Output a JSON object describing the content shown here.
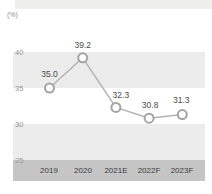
{
  "colors": {
    "band_light": "#ececec",
    "axis_band": "#c5c5c5",
    "top_strip": "#eeefec",
    "line": "#b3b3b3",
    "marker_stroke": "#a3a3a3",
    "marker_fill": "#ffffff",
    "point_label_text": "#4a4a4a",
    "tick_text": "#929292",
    "category_text": "#3c3c3c"
  },
  "chart_data": {
    "type": "line",
    "categories": [
      "2019",
      "2020",
      "2021E",
      "2022F",
      "2023F"
    ],
    "values": [
      35.0,
      39.2,
      32.3,
      30.8,
      31.3
    ],
    "point_labels": [
      "35.0",
      "39.2",
      "32.3",
      "30.8",
      "31.3"
    ],
    "yticks": [
      "40",
      "35",
      "30",
      "25"
    ],
    "ylabel": "(%)",
    "xlabel": "",
    "title": "",
    "ylim": [
      25,
      45
    ],
    "grid": "alternating horizontal bands",
    "legend": "none",
    "markers": "open circles with data labels above"
  }
}
